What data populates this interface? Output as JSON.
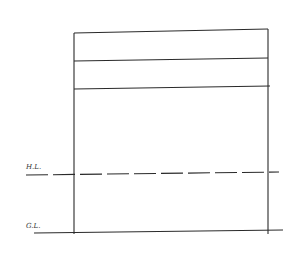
{
  "diagram": {
    "title": "",
    "labels": {
      "horizon_line": "H.L.",
      "ground_line": "G.L."
    },
    "colors": {
      "stroke": "#2a2a2a",
      "background": "#ffffff"
    }
  }
}
